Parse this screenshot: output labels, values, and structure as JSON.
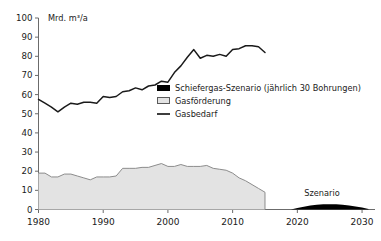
{
  "chart_data": {
    "type": "area",
    "title": "",
    "subtitle": "",
    "unit_label": "Mrd. m³/a",
    "xlabel": "",
    "ylabel": "",
    "xlim": [
      1980,
      2032
    ],
    "ylim": [
      0,
      100
    ],
    "ytick_labels": [
      "0",
      "10",
      "20",
      "30",
      "40",
      "50",
      "60",
      "70",
      "80",
      "90",
      "100"
    ],
    "ytick_values": [
      0,
      10,
      20,
      30,
      40,
      50,
      60,
      70,
      80,
      90,
      100
    ],
    "xtick_labels": [
      "1980",
      "1990",
      "2000",
      "2010",
      "2020",
      "2030"
    ],
    "xtick_values": [
      1980,
      1990,
      2000,
      2010,
      2020,
      2030
    ],
    "grid": false,
    "legend_position": "center-right",
    "colors": {
      "demand_line": "#1a1a1a",
      "production_fill": "#e3e3e3",
      "production_stroke": "#8c8c8c",
      "scenario_fill": "#000000",
      "axis": "#6b6b6b",
      "text": "#1a1a1a"
    },
    "series": [
      {
        "name": "Gasbedarf",
        "type": "line",
        "x": [
          1980,
          1981,
          1982,
          1983,
          1984,
          1985,
          1986,
          1987,
          1988,
          1989,
          1990,
          1991,
          1992,
          1993,
          1994,
          1995,
          1996,
          1997,
          1998,
          1999,
          2000,
          2001,
          2002,
          2003,
          2004,
          2005,
          2006,
          2007,
          2008,
          2009,
          2010,
          2011,
          2012,
          2013,
          2014,
          2015
        ],
        "values": [
          57.5,
          55.5,
          53.5,
          51.0,
          53.5,
          55.5,
          55.0,
          56.0,
          56.0,
          55.5,
          59.0,
          58.5,
          59.0,
          61.5,
          62.0,
          63.5,
          62.5,
          64.5,
          65.0,
          67.0,
          66.5,
          71.5,
          75.0,
          79.5,
          83.5,
          79.0,
          80.5,
          80.0,
          81.0,
          80.0,
          83.5,
          84.0,
          85.5,
          85.5,
          85.0,
          82.0
        ],
        "label_end_value": 82.0
      },
      {
        "name": "Gasförderung",
        "type": "area",
        "x": [
          1980,
          1981,
          1982,
          1983,
          1984,
          1985,
          1986,
          1987,
          1988,
          1989,
          1990,
          1991,
          1992,
          1993,
          1994,
          1995,
          1996,
          1997,
          1998,
          1999,
          2000,
          2001,
          2002,
          2003,
          2004,
          2005,
          2006,
          2007,
          2008,
          2009,
          2010,
          2011,
          2012,
          2013,
          2014,
          2015
        ],
        "values": [
          19.0,
          19.0,
          17.0,
          17.0,
          18.5,
          18.5,
          17.5,
          16.5,
          15.5,
          17.0,
          17.0,
          17.0,
          17.5,
          21.5,
          21.5,
          21.5,
          22.0,
          22.0,
          23.0,
          24.0,
          22.5,
          22.5,
          23.5,
          22.5,
          22.5,
          22.5,
          23.0,
          21.5,
          21.0,
          20.5,
          19.0,
          16.5,
          15.0,
          13.0,
          11.0,
          9.0
        ]
      },
      {
        "name": "Schiefergas-Szenario (jährlich 30 Bohrungen)",
        "type": "area",
        "x": [
          2019,
          2020,
          2021,
          2022,
          2023,
          2024,
          2025,
          2026,
          2027,
          2028,
          2029,
          2030,
          2031
        ],
        "values": [
          0.0,
          0.8,
          1.5,
          2.1,
          2.5,
          2.7,
          2.8,
          2.7,
          2.5,
          2.1,
          1.6,
          1.0,
          0.2
        ]
      }
    ],
    "legend": [
      {
        "label": "Schiefergas-Szenario (jährlich 30 Bohrungen)",
        "marker": "filled-square",
        "color": "#000000"
      },
      {
        "label": "Gasförderung",
        "marker": "outlined-square",
        "color": "#e3e3e3"
      },
      {
        "label": "Gasbedarf",
        "marker": "line",
        "color": "#1a1a1a"
      }
    ],
    "annotations": [
      {
        "text": "Szenario",
        "x": 2025,
        "y": 6.5
      }
    ]
  }
}
